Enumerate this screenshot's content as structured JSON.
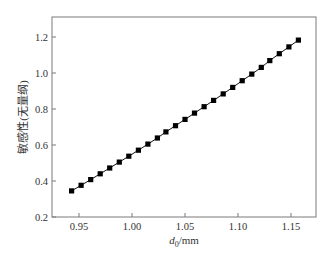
{
  "chart_data": {
    "type": "line",
    "title": "",
    "xlabel": "d0/mm",
    "xlabel_parts": {
      "var": "d",
      "sub": "0",
      "unit": "/mm"
    },
    "ylabel": "敏感性(无量纲)",
    "xlim": [
      0.93,
      1.175
    ],
    "ylim": [
      0.2,
      1.3
    ],
    "xticks": [
      0.95,
      1.0,
      1.05,
      1.1,
      1.15
    ],
    "xtick_labels": [
      "0.95",
      "1.00",
      "1.05",
      "1.10",
      "1.15"
    ],
    "yticks": [
      0.2,
      0.4,
      0.6,
      0.8,
      1.0,
      1.2
    ],
    "ytick_labels": [
      "0.2",
      "0.4",
      "0.6",
      "0.8",
      "1.0",
      "1.2"
    ],
    "grid": false,
    "legend": null,
    "series": [
      {
        "name": "sensitivity",
        "marker": "square",
        "color": "#000000",
        "x": [
          0.943,
          0.952,
          0.961,
          0.97,
          0.979,
          0.988,
          0.997,
          1.006,
          1.015,
          1.024,
          1.032,
          1.041,
          1.05,
          1.059,
          1.068,
          1.077,
          1.086,
          1.095,
          1.104,
          1.113,
          1.122,
          1.13,
          1.139,
          1.148,
          1.157
        ],
        "y": [
          0.345,
          0.376,
          0.408,
          0.44,
          0.472,
          0.505,
          0.538,
          0.571,
          0.605,
          0.639,
          0.673,
          0.707,
          0.742,
          0.777,
          0.813,
          0.848,
          0.884,
          0.92,
          0.957,
          0.994,
          1.031,
          1.069,
          1.107,
          1.145,
          1.183
        ]
      }
    ]
  }
}
